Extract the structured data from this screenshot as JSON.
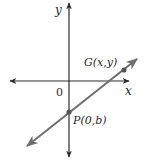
{
  "diagram": {
    "type": "coordinate-plane-line",
    "axes": {
      "x_label": "x",
      "y_label": "y",
      "origin_label": "0"
    },
    "points": [
      {
        "id": "P",
        "label": "P(0,b)",
        "name": "P",
        "coords": "(0,b)"
      },
      {
        "id": "G",
        "label": "G(x,y)",
        "name": "G",
        "coords": "(x,y)"
      }
    ],
    "line": {
      "description": "line through P(0,b) and G(x,y) with positive slope, arrows at both ends"
    },
    "colors": {
      "axis": "#2a2a2a",
      "line": "#6e6e6e",
      "point": "#555555",
      "text": "#2a2a2a"
    }
  }
}
